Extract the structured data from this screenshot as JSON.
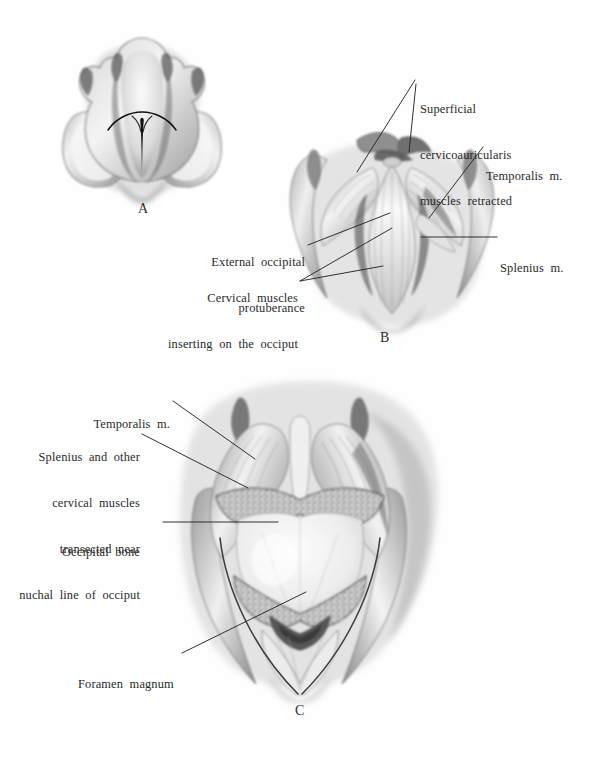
{
  "figure": {
    "type": "anatomical-illustration-plate",
    "medium": "grayscale wash and pencil drawing",
    "panels": [
      {
        "letter": "A",
        "caption_letter": "A",
        "description": "Dorsal view of head with ears reflected laterally and midline skin incision outlined"
      },
      {
        "letter": "B",
        "caption_letter": "B",
        "description": "Superficial dissection, cervicoauricularis muscles retracted exposing cervical musculature"
      },
      {
        "letter": "C",
        "caption_letter": "C",
        "description": "Deep dissection, cervical muscles transected exposing occipital bone and foramen magnum"
      }
    ],
    "labels": {
      "panel_b": [
        {
          "id": "superficial-cervicoauricularis",
          "lines": [
            "Superficial",
            "cervicoauricularis",
            "muscles  retracted"
          ],
          "align": "left"
        },
        {
          "id": "temporalis-m-b",
          "lines": [
            "Temporalis  m."
          ],
          "align": "left"
        },
        {
          "id": "splenius-m-b",
          "lines": [
            "Splenius  m."
          ],
          "align": "left"
        },
        {
          "id": "external-occipital-protuberance",
          "lines": [
            "External  occipital",
            "protuberance"
          ],
          "align": "right"
        },
        {
          "id": "cervical-muscles-inserting",
          "lines": [
            "Cervical  muscles",
            "inserting  on  the  occiput"
          ],
          "align": "right"
        }
      ],
      "panel_c": [
        {
          "id": "temporalis-m-c",
          "lines": [
            "Temporalis  m."
          ],
          "align": "right"
        },
        {
          "id": "splenius-transected",
          "lines": [
            "Splenius  and  other",
            "cervical  muscles",
            "transected  near",
            "nuchal  line  of  occiput"
          ],
          "align": "right"
        },
        {
          "id": "occipital-bone",
          "lines": [
            "Occipital  bone"
          ],
          "align": "left"
        },
        {
          "id": "foramen-magnum",
          "lines": [
            "Foramen  magnum"
          ],
          "align": "left"
        }
      ]
    },
    "colors": {
      "background": "#ffffff",
      "text": "#2a2a2a",
      "leader_line": "#262626",
      "wash_light": "#e9e9e9",
      "wash_mid": "#b8b8b8",
      "wash_dark": "#6e6e6e",
      "wash_darkest": "#3b3b3b"
    }
  }
}
